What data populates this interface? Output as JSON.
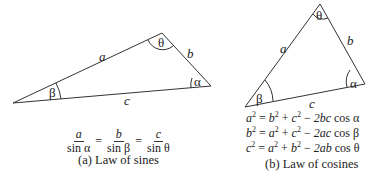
{
  "left_panel": {
    "sides": {
      "a": "a",
      "b": "b",
      "c": "c"
    },
    "angles": {
      "alpha": "α",
      "beta": "β",
      "theta": "θ"
    },
    "law": {
      "t1_num": "a",
      "t1_den": "sin α",
      "t2_num": "b",
      "t2_den": "sin β",
      "t3_num": "c",
      "t3_den": "sin θ",
      "eq": "="
    },
    "caption": "(a) Law of sines"
  },
  "right_panel": {
    "sides": {
      "a": "a",
      "b": "b",
      "c": "c"
    },
    "angles": {
      "alpha": "α",
      "beta": "β",
      "theta": "θ"
    },
    "formulas": [
      {
        "lhs": "a",
        "rhs1": "b",
        "rhs2": "c",
        "tail": "2bc",
        "cos": "cos α"
      },
      {
        "lhs": "b",
        "rhs1": "a",
        "rhs2": "c",
        "tail": "2ac",
        "cos": "cos β"
      },
      {
        "lhs": "c",
        "rhs1": "a",
        "rhs2": "b",
        "tail": "2ab",
        "cos": "cos θ"
      }
    ],
    "caption": "(b) Law of cosines"
  },
  "colors": {
    "line": "#333333",
    "background": "#ffffff"
  }
}
